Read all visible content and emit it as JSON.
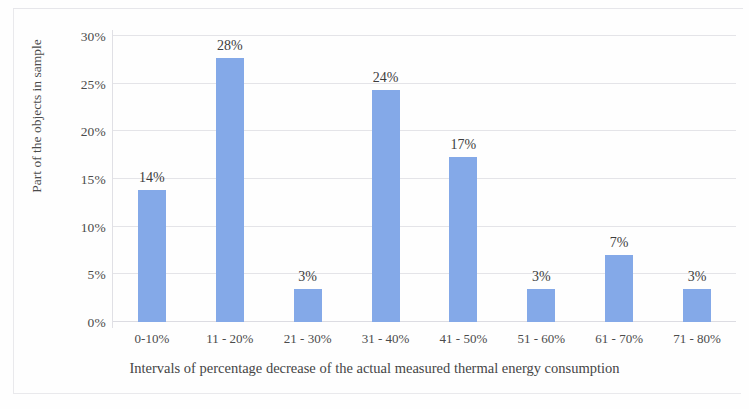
{
  "chart_data": {
    "type": "bar",
    "title": "",
    "subtitle": "",
    "categories": [
      "0-10%",
      "11 - 20%",
      "21 - 30%",
      "31 - 40%",
      "41 - 50%",
      "51 - 60%",
      "61 - 70%",
      "71 - 80%"
    ],
    "values": [
      13.9,
      27.7,
      3.5,
      24.3,
      17.3,
      3.5,
      7.0,
      3.5
    ],
    "data_labels": [
      "14%",
      "28%",
      "3%",
      "24%",
      "17%",
      "3%",
      "7%",
      "3%"
    ],
    "xlabel": "Intervals of percentage decrease of the actual measured thermal energy consumption",
    "ylabel": "Part of the objects in sample",
    "ylim": [
      0,
      30
    ],
    "ytick_labels": [
      "0%",
      "5%",
      "10%",
      "15%",
      "20%",
      "25%",
      "30%"
    ],
    "ytick_values": [
      0,
      5,
      10,
      15,
      20,
      25,
      30
    ],
    "grid": "horizontal",
    "legend": "none",
    "series_color": "#84a9e8",
    "gridline_color": "#e4e4e8",
    "background_color": "#fefefe"
  }
}
